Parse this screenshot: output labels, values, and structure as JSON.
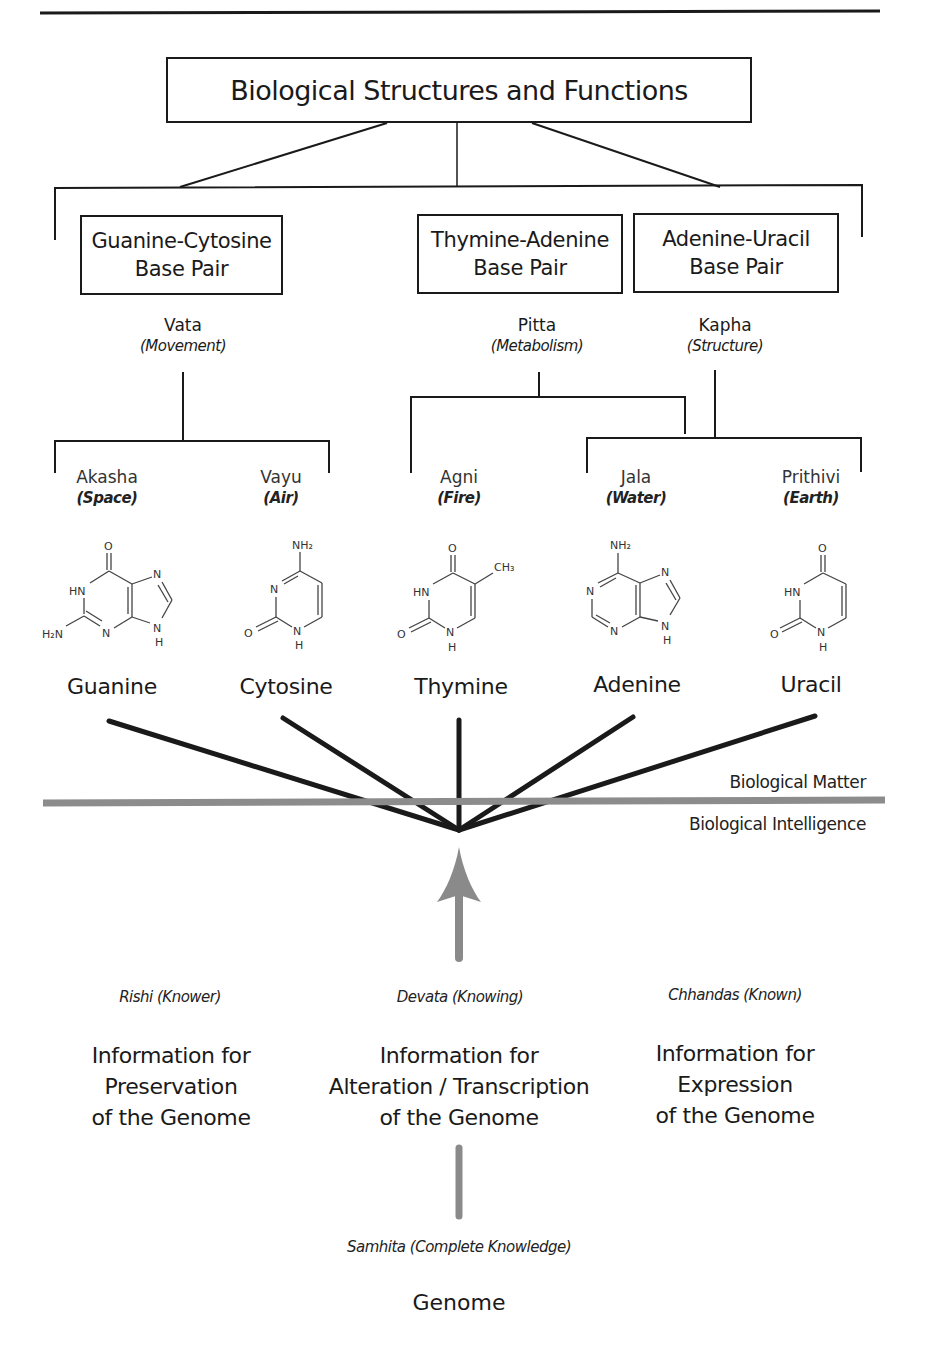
{
  "title": "Biological Structures and Functions",
  "base_pairs": [
    {
      "line1": "Guanine-Cytosine",
      "line2": "Base Pair"
    },
    {
      "line1": "Thymine-Adenine",
      "line2": "Base Pair"
    },
    {
      "line1": "Adenine-Uracil",
      "line2": "Base Pair"
    }
  ],
  "doshas": [
    {
      "name": "Vata",
      "meaning": "(Movement)"
    },
    {
      "name": "Pitta",
      "meaning": "(Metabolism)"
    },
    {
      "name": "Kapha",
      "meaning": "(Structure)"
    }
  ],
  "elements": [
    {
      "name": "Akasha",
      "meaning": "(Space)"
    },
    {
      "name": "Vayu",
      "meaning": "(Air)"
    },
    {
      "name": "Agni",
      "meaning": "(Fire)"
    },
    {
      "name": "Jala",
      "meaning": "(Water)"
    },
    {
      "name": "Prithivi",
      "meaning": "(Earth)"
    }
  ],
  "bases": [
    {
      "name": "Guanine",
      "structure": "guanine-structure"
    },
    {
      "name": "Cytosine",
      "structure": "cytosine-structure"
    },
    {
      "name": "Thymine",
      "structure": "thymine-structure"
    },
    {
      "name": "Adenine",
      "structure": "adenine-structure"
    },
    {
      "name": "Uracil",
      "structure": "uracil-structure"
    }
  ],
  "atoms": {
    "O": "O",
    "HN": "HN",
    "N": "N",
    "H": "H",
    "H2N": "H₂N",
    "NH2": "NH₂",
    "CH3": "CH₃"
  },
  "divider": {
    "above_label": "Biological Matter",
    "below_label": "Biological Intelligence",
    "color": "#8c8c8c"
  },
  "aspects": [
    {
      "label": "Rishi (Knower)",
      "info": [
        "Information for",
        "Preservation",
        "of the Genome"
      ]
    },
    {
      "label": "Devata (Knowing)",
      "info": [
        "Information for",
        "Alteration / Transcription",
        "of the Genome"
      ]
    },
    {
      "label": "Chhandas (Known)",
      "info": [
        "Information for",
        "Expression",
        "of the Genome"
      ]
    }
  ],
  "source": {
    "label": "Samhita (Complete Knowledge)",
    "name": "Genome"
  },
  "colors": {
    "line": "#1a1a1a",
    "arrow": "#8a8a8a"
  }
}
